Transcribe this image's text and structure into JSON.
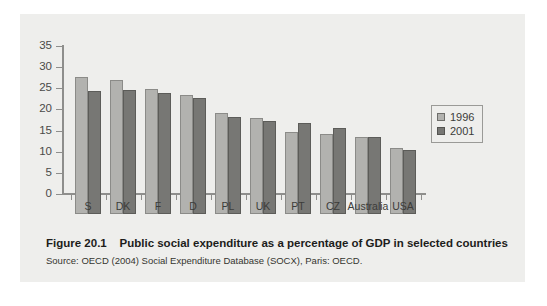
{
  "figure": {
    "caption_label": "Figure 20.1",
    "caption_text": "Public social expenditure as a percentage of GDP in selected countries",
    "source": "Source: OECD (2004) Social Expenditure Database (SOCX), Paris: OECD."
  },
  "legend": {
    "position": "right",
    "entries": [
      {
        "label": "1996",
        "color": "#b2b2af"
      },
      {
        "label": "2001",
        "color": "#777774"
      }
    ]
  },
  "axis": {
    "y_ticks": [
      "0",
      "5",
      "10",
      "15",
      "20",
      "25",
      "30",
      "35"
    ],
    "x_ticks": [
      "S",
      "DK",
      "F",
      "D",
      "PL",
      "UK",
      "PT",
      "CZ",
      "Australia",
      "USA"
    ]
  },
  "chart_data": {
    "type": "bar",
    "title": "Public social expenditure as a percentage of GDP in selected countries",
    "xlabel": "",
    "ylabel": "",
    "ylim": [
      0,
      35
    ],
    "ytick_step": 5,
    "grid": false,
    "legend_position": "right",
    "categories": [
      "S",
      "DK",
      "F",
      "D",
      "PL",
      "UK",
      "PT",
      "CZ",
      "Australia",
      "USA"
    ],
    "series": [
      {
        "name": "1996",
        "color": "#b2b2af",
        "values": [
          32.5,
          31.8,
          29.5,
          28.2,
          24.0,
          22.8,
          19.4,
          18.9,
          18.3,
          15.6
        ]
      },
      {
        "name": "2001",
        "color": "#777774",
        "values": [
          29.0,
          29.3,
          28.6,
          27.5,
          23.0,
          21.9,
          21.5,
          20.3,
          18.2,
          15.2
        ]
      }
    ]
  }
}
